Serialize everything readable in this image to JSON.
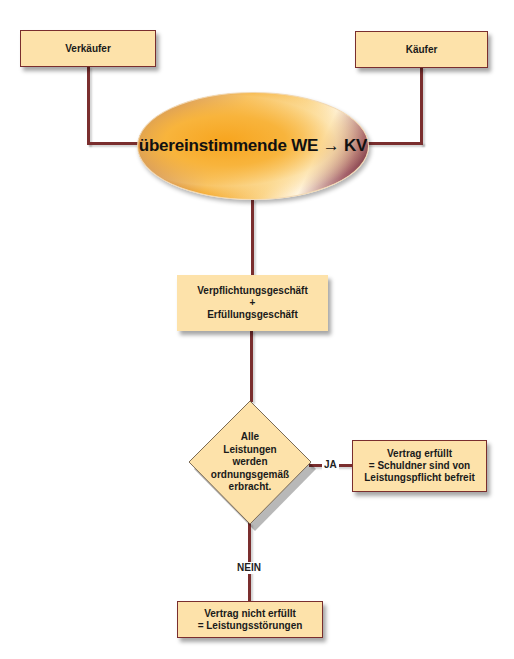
{
  "diagram": {
    "colors": {
      "box_fill": "#fde2aa",
      "connector": "#7a2e2e",
      "ellipse_gradient": [
        "#6b1510",
        "#f3a11d",
        "#fff4de",
        "#5b1a22"
      ]
    },
    "nodes": {
      "seller": {
        "label": "Verkäufer"
      },
      "buyer": {
        "label": "Käufer"
      },
      "agreement": {
        "label": "übereinstimmende WE → KV"
      },
      "transactions": {
        "label": "Verpflichtungsgeschäft\n+\nErfüllungsgeschäft"
      },
      "decision": {
        "label": "Alle\nLeistungen\nwerden\nordnungsgemäß\nerbracht."
      },
      "fulfilled": {
        "label": "Vertrag erfüllt\n= Schuldner sind von\nLeistungspflicht befreit"
      },
      "not_fulfilled": {
        "label": "Vertrag nicht erfüllt\n= Leistungsstörungen"
      }
    },
    "edges": {
      "yes_label": "JA",
      "no_label": "NEIN"
    }
  }
}
